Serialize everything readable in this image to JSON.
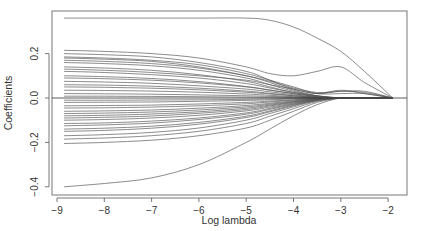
{
  "chart_data": {
    "type": "line",
    "title": "",
    "xlabel": "Log lambda",
    "ylabel": "Coefficients",
    "xlim": [
      -9.1,
      -1.6
    ],
    "ylim": [
      -0.42,
      0.4
    ],
    "xticks": [
      -9,
      -8,
      -7,
      -6,
      -5,
      -4,
      -3,
      -2
    ],
    "yticks": [
      -0.4,
      -0.2,
      0.0,
      0.2
    ],
    "ytick_labels": [
      "-0.4",
      "-0.2",
      "0.0",
      "0.2"
    ],
    "xtick_labels": [
      "-9",
      "-8",
      "-7",
      "-6",
      "-5",
      "-4",
      "-3",
      "-2"
    ],
    "grid": false,
    "legend": null,
    "zero_line": true,
    "line_color": "#555555",
    "x": [
      -8.85,
      -8,
      -7,
      -6,
      -5,
      -4.5,
      -4,
      -3.5,
      -3,
      -2.5,
      -1.9
    ],
    "series": [
      {
        "name": "coef_1",
        "values": [
          0.36,
          0.36,
          0.36,
          0.36,
          0.36,
          0.35,
          0.32,
          0.27,
          0.21,
          0.12,
          0.0
        ]
      },
      {
        "name": "coef_2",
        "values": [
          0.215,
          0.21,
          0.2,
          0.18,
          0.14,
          0.11,
          0.1,
          0.12,
          0.14,
          0.07,
          0.0
        ]
      },
      {
        "name": "coef_3",
        "values": [
          0.2,
          0.195,
          0.185,
          0.16,
          0.12,
          0.08,
          0.04,
          0.02,
          0.03,
          0.025,
          0.0
        ]
      },
      {
        "name": "coef_4",
        "values": [
          0.185,
          0.18,
          0.17,
          0.15,
          0.11,
          0.08,
          0.05,
          0.02,
          0.02,
          0.02,
          0.0
        ]
      },
      {
        "name": "coef_5",
        "values": [
          0.18,
          0.175,
          0.165,
          0.14,
          0.1,
          0.07,
          0.035,
          0.01,
          0.0,
          0.0,
          0.0
        ]
      },
      {
        "name": "coef_6",
        "values": [
          0.17,
          0.165,
          0.155,
          0.135,
          0.1,
          0.075,
          0.045,
          0.025,
          0.03,
          0.03,
          0.0
        ]
      },
      {
        "name": "coef_7",
        "values": [
          0.16,
          0.155,
          0.145,
          0.125,
          0.09,
          0.06,
          0.03,
          0.01,
          0.0,
          0.0,
          0.0
        ]
      },
      {
        "name": "coef_8",
        "values": [
          0.14,
          0.135,
          0.125,
          0.105,
          0.075,
          0.05,
          0.025,
          0.01,
          0.0,
          0.0,
          0.0
        ]
      },
      {
        "name": "coef_9",
        "values": [
          0.13,
          0.125,
          0.115,
          0.1,
          0.08,
          0.06,
          0.04,
          0.02,
          0.035,
          0.02,
          0.0
        ]
      },
      {
        "name": "coef_10",
        "values": [
          0.12,
          0.115,
          0.105,
          0.09,
          0.065,
          0.045,
          0.025,
          0.008,
          0.0,
          0.0,
          0.0
        ]
      },
      {
        "name": "coef_11",
        "values": [
          0.1,
          0.096,
          0.088,
          0.074,
          0.052,
          0.036,
          0.02,
          0.006,
          0.0,
          0.0,
          0.0
        ]
      },
      {
        "name": "coef_12",
        "values": [
          0.09,
          0.087,
          0.08,
          0.068,
          0.05,
          0.035,
          0.02,
          0.006,
          0.0,
          0.0,
          0.0
        ]
      },
      {
        "name": "coef_13",
        "values": [
          0.075,
          0.072,
          0.066,
          0.055,
          0.04,
          0.028,
          0.015,
          0.004,
          0.0,
          0.0,
          0.0
        ]
      },
      {
        "name": "coef_14",
        "values": [
          0.06,
          0.058,
          0.053,
          0.044,
          0.031,
          0.021,
          0.011,
          0.003,
          0.0,
          0.0,
          0.0
        ]
      },
      {
        "name": "coef_15",
        "values": [
          0.05,
          0.048,
          0.044,
          0.037,
          0.026,
          0.018,
          0.01,
          0.003,
          0.0,
          0.0,
          0.0
        ]
      },
      {
        "name": "coef_16",
        "values": [
          0.035,
          0.034,
          0.031,
          0.026,
          0.018,
          0.012,
          0.006,
          0.002,
          0.0,
          0.0,
          0.0
        ]
      },
      {
        "name": "coef_17",
        "values": [
          0.02,
          0.019,
          0.017,
          0.014,
          0.01,
          0.007,
          0.004,
          0.001,
          0.0,
          0.0,
          0.0
        ]
      },
      {
        "name": "coef_18",
        "values": [
          0.008,
          0.008,
          0.007,
          0.006,
          0.004,
          0.003,
          0.002,
          0.001,
          0.0,
          0.0,
          0.0
        ]
      },
      {
        "name": "coef_19",
        "values": [
          -0.01,
          -0.01,
          -0.009,
          -0.008,
          -0.006,
          -0.004,
          -0.002,
          0.0,
          0.0,
          0.0,
          0.0
        ]
      },
      {
        "name": "coef_20",
        "values": [
          -0.02,
          -0.019,
          -0.018,
          -0.015,
          -0.011,
          -0.008,
          -0.004,
          -0.001,
          0.0,
          0.0,
          0.0
        ]
      },
      {
        "name": "coef_21",
        "values": [
          -0.035,
          -0.034,
          -0.032,
          -0.027,
          -0.02,
          -0.014,
          -0.008,
          -0.002,
          0.0,
          0.0,
          0.0
        ]
      },
      {
        "name": "coef_22",
        "values": [
          -0.045,
          -0.044,
          -0.041,
          -0.035,
          -0.026,
          -0.018,
          -0.01,
          -0.003,
          0.0,
          0.0,
          0.0
        ]
      },
      {
        "name": "coef_23",
        "values": [
          -0.06,
          -0.058,
          -0.054,
          -0.046,
          -0.034,
          -0.024,
          -0.013,
          -0.004,
          0.0,
          0.0,
          0.0
        ]
      },
      {
        "name": "coef_24",
        "values": [
          -0.07,
          -0.068,
          -0.063,
          -0.054,
          -0.04,
          -0.028,
          -0.016,
          -0.005,
          0.0,
          0.0,
          0.0
        ]
      },
      {
        "name": "coef_25",
        "values": [
          -0.08,
          -0.078,
          -0.072,
          -0.062,
          -0.046,
          -0.032,
          -0.018,
          -0.006,
          0.0,
          0.0,
          0.0
        ]
      },
      {
        "name": "coef_26",
        "values": [
          -0.09,
          -0.087,
          -0.081,
          -0.069,
          -0.052,
          -0.036,
          -0.02,
          -0.006,
          0.0,
          0.0,
          0.0
        ]
      },
      {
        "name": "coef_27",
        "values": [
          -0.1,
          -0.097,
          -0.09,
          -0.078,
          -0.058,
          -0.041,
          -0.023,
          -0.007,
          0.0,
          0.0,
          0.0
        ]
      },
      {
        "name": "coef_28",
        "values": [
          -0.115,
          -0.112,
          -0.104,
          -0.09,
          -0.067,
          -0.047,
          -0.026,
          -0.008,
          0.0,
          0.0,
          0.0
        ]
      },
      {
        "name": "coef_29",
        "values": [
          -0.125,
          -0.121,
          -0.113,
          -0.097,
          -0.073,
          -0.051,
          -0.029,
          -0.009,
          0.0,
          0.0,
          0.0
        ]
      },
      {
        "name": "coef_30",
        "values": [
          -0.14,
          -0.136,
          -0.127,
          -0.11,
          -0.082,
          -0.058,
          -0.032,
          -0.01,
          0.0,
          0.0,
          0.0
        ]
      },
      {
        "name": "coef_31",
        "values": [
          -0.15,
          -0.146,
          -0.136,
          -0.118,
          -0.088,
          -0.062,
          -0.035,
          -0.011,
          0.0,
          0.0,
          0.0
        ]
      },
      {
        "name": "coef_32",
        "values": [
          -0.17,
          -0.165,
          -0.155,
          -0.135,
          -0.1,
          -0.07,
          -0.04,
          -0.012,
          0.0,
          0.0,
          0.0
        ]
      },
      {
        "name": "coef_33",
        "values": [
          -0.185,
          -0.18,
          -0.17,
          -0.15,
          -0.115,
          -0.082,
          -0.048,
          -0.015,
          0.0,
          0.0,
          0.0
        ]
      },
      {
        "name": "coef_34",
        "values": [
          -0.205,
          -0.2,
          -0.19,
          -0.17,
          -0.135,
          -0.1,
          -0.06,
          -0.02,
          0.0,
          0.0,
          0.0
        ]
      },
      {
        "name": "coef_35",
        "values": [
          -0.4,
          -0.385,
          -0.36,
          -0.3,
          -0.2,
          -0.14,
          -0.08,
          -0.03,
          0.0,
          0.0,
          0.0
        ]
      }
    ]
  }
}
